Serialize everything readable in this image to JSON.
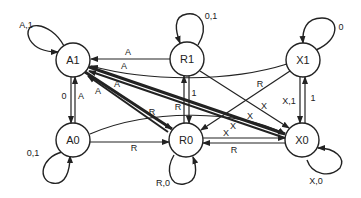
{
  "diagram": {
    "type": "state-transition",
    "nodes": [
      {
        "id": "A1",
        "label": "A1",
        "x": 73,
        "y": 60
      },
      {
        "id": "R1",
        "label": "R1",
        "x": 187,
        "y": 59
      },
      {
        "id": "X1",
        "label": "X1",
        "x": 303,
        "y": 60
      },
      {
        "id": "A0",
        "label": "A0",
        "x": 73,
        "y": 140
      },
      {
        "id": "R0",
        "label": "R0",
        "x": 186,
        "y": 140
      },
      {
        "id": "X0",
        "label": "X0",
        "x": 302,
        "y": 140
      }
    ],
    "self_loops": [
      {
        "node": "A1",
        "label": "A,1"
      },
      {
        "node": "R1",
        "label": "0,1"
      },
      {
        "node": "X1",
        "label": "0"
      },
      {
        "node": "A0",
        "label": "0,1"
      },
      {
        "node": "R0",
        "label": "R,0"
      },
      {
        "node": "X0",
        "label": "X,0"
      }
    ],
    "edges": [
      {
        "from": "R1",
        "to": "A1",
        "label": "A"
      },
      {
        "from": "X1",
        "to": "A1",
        "label": "A"
      },
      {
        "from": "A0",
        "to": "A1",
        "label": "A"
      },
      {
        "from": "A1",
        "to": "A0",
        "label": "0"
      },
      {
        "from": "R0",
        "to": "A1",
        "label": "A"
      },
      {
        "from": "X0",
        "to": "A1",
        "label": "A"
      },
      {
        "from": "A1",
        "to": "R0",
        "label": "R"
      },
      {
        "from": "A0",
        "to": "R0",
        "label": "R"
      },
      {
        "from": "R0",
        "to": "R1",
        "label": "1"
      },
      {
        "from": "R1",
        "to": "R0",
        "label": "R"
      },
      {
        "from": "X1",
        "to": "R0",
        "label": "R"
      },
      {
        "from": "X0",
        "to": "R0",
        "label": "R"
      },
      {
        "from": "R1",
        "to": "X0",
        "label": "X"
      },
      {
        "from": "A1",
        "to": "X0",
        "label": "X"
      },
      {
        "from": "A0",
        "to": "X0",
        "label": "X"
      },
      {
        "from": "R0",
        "to": "X0",
        "label": "X"
      },
      {
        "from": "X1",
        "to": "X0",
        "label": "X,1"
      },
      {
        "from": "X0",
        "to": "X1",
        "label": "1"
      }
    ]
  },
  "labels": {
    "A1": "A1",
    "R1": "R1",
    "X1": "X1",
    "A0": "A0",
    "R0": "R0",
    "X0": "X0",
    "loop_A1": "A,1",
    "loop_R1": "0,1",
    "loop_X1": "0",
    "loop_A0": "0,1",
    "loop_R0": "R,0",
    "loop_X0": "X,0",
    "e_R1_A1": "A",
    "e_X1_A1": "A",
    "e_A0_A1": "A",
    "e_A1_A0": "0",
    "e_R0_A1": "A",
    "e_X0_A1": "A",
    "e_A1_R0": "R",
    "e_A0_R0": "R",
    "e_R0_R1": "1",
    "e_R1_R0": "R",
    "e_X1_R0": "R",
    "e_X0_R0": "R",
    "e_R1_X0": "X",
    "e_A1_X0": "X",
    "e_A0_X0": "X",
    "e_R0_X0": "X",
    "e_X1_X0": "X,1",
    "e_X0_X1": "1"
  }
}
